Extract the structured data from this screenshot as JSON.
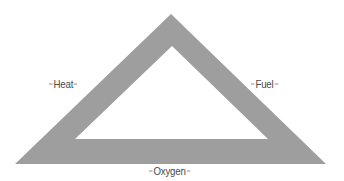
{
  "diagram": {
    "fill_color": "#9e9e9e",
    "shape": {
      "outer": [
        [
          171,
          14
        ],
        [
          326,
          164
        ],
        [
          15,
          164
        ]
      ],
      "inner": [
        [
          172,
          46
        ],
        [
          268,
          139
        ],
        [
          75,
          139
        ]
      ]
    },
    "labels": {
      "heat": "Heat",
      "fuel": "Fuel",
      "oxygen": "Oxygen"
    }
  }
}
